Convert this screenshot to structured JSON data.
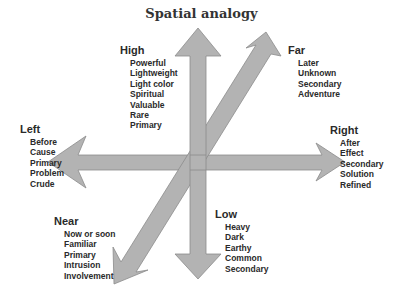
{
  "title": "Spatial analogy",
  "colors": {
    "arrow_fill": "#b3b3b3",
    "arrow_stroke": "#8c8c8c",
    "text": "#2a2a2a"
  },
  "groups": {
    "high": {
      "label": "High",
      "items": [
        "Powerful",
        "Lightweight",
        "Light color",
        "Spiritual",
        "Valuable",
        "Rare",
        "Primary"
      ]
    },
    "far": {
      "label": "Far",
      "items": [
        "Later",
        "Unknown",
        "Secondary",
        "Adventure"
      ]
    },
    "left": {
      "label": "Left",
      "items": [
        "Before",
        "Cause",
        "Primary",
        "Problem",
        "Crude"
      ]
    },
    "right": {
      "label": "Right",
      "items": [
        "After",
        "Effect",
        "Secondary",
        "Solution",
        "Refined"
      ]
    },
    "near": {
      "label": "Near",
      "items": [
        "Now or soon",
        "Familiar",
        "Primary",
        "Intrusion",
        "Involvement"
      ]
    },
    "low": {
      "label": "Low",
      "items": [
        "Heavy",
        "Dark",
        "Earthy",
        "Common",
        "Secondary"
      ]
    }
  }
}
